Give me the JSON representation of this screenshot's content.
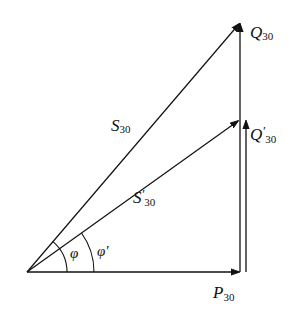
{
  "diagram": {
    "vectors": {
      "P": {
        "symbol": "P",
        "prime": "",
        "subscript": "30"
      },
      "Q": {
        "symbol": "Q",
        "prime": "",
        "subscript": "30"
      },
      "Q_prime": {
        "symbol": "Q",
        "prime": "′",
        "subscript": "30"
      },
      "S": {
        "symbol": "S",
        "prime": "",
        "subscript": "30"
      },
      "S_prime": {
        "symbol": "S",
        "prime": "′",
        "subscript": "30"
      }
    },
    "angles": {
      "phi": {
        "symbol": "φ"
      },
      "phi_prime": {
        "symbol": "φ′"
      }
    },
    "colors": {
      "stroke": "#111111",
      "background": "#ffffff"
    }
  }
}
